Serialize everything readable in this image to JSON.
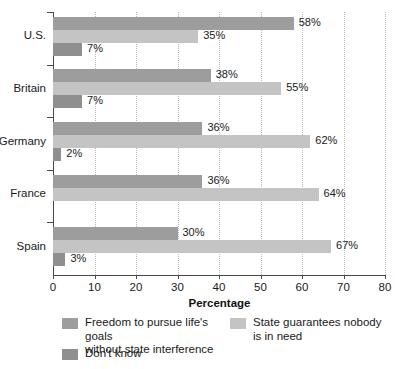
{
  "chart_data": {
    "type": "bar",
    "orientation": "horizontal",
    "title": "",
    "xlabel": "Percentage",
    "ylabel": "",
    "xlim": [
      0,
      80
    ],
    "xticks": [
      0,
      10,
      20,
      30,
      40,
      50,
      60,
      70,
      80
    ],
    "grid": true,
    "grid_style": "dotted-vertical",
    "legend_position": "bottom",
    "categories": [
      "U.S.",
      "Britain",
      "Germany",
      "France",
      "Spain"
    ],
    "series": [
      {
        "name": "Freedom to pursue life's goals without state interference",
        "color": "#9d9d9d",
        "values": [
          58,
          38,
          36,
          36,
          30
        ],
        "labels": [
          "58%",
          "38%",
          "36%",
          "36%",
          "30%"
        ]
      },
      {
        "name": "State guarantees nobody is in need",
        "color": "#c4c4c4",
        "values": [
          35,
          55,
          62,
          64,
          67
        ],
        "labels": [
          "35%",
          "55%",
          "62%",
          "64%",
          "67%"
        ]
      },
      {
        "name": "Don't know",
        "color": "#8f8f8f",
        "values": [
          7,
          7,
          2,
          0,
          3
        ],
        "labels": [
          "7%",
          "7%",
          "2%",
          "",
          "3%"
        ]
      }
    ]
  },
  "axis": {
    "x_title": "Percentage",
    "tick_labels": [
      "0",
      "10",
      "20",
      "30",
      "40",
      "50",
      "60",
      "70",
      "80"
    ]
  },
  "categories": {
    "c0": "U.S.",
    "c1": "Britain",
    "c2": "Germany",
    "c3": "France",
    "c4": "Spain"
  },
  "values": {
    "us": {
      "freedom": "58%",
      "state": "35%",
      "dk": "7%"
    },
    "britain": {
      "freedom": "38%",
      "state": "55%",
      "dk": "7%"
    },
    "germany": {
      "freedom": "36%",
      "state": "62%",
      "dk": "2%"
    },
    "france": {
      "freedom": "36%",
      "state": "64%",
      "dk": ""
    },
    "spain": {
      "freedom": "30%",
      "state": "67%",
      "dk": "3%"
    }
  },
  "legend": {
    "items": [
      {
        "label": "Freedom to pursue life's goals\nwithout state interference",
        "color": "#9d9d9d"
      },
      {
        "label": "State guarantees nobody\nis in need",
        "color": "#c4c4c4"
      },
      {
        "label": "Don't know",
        "color": "#8f8f8f"
      }
    ]
  },
  "colors": {
    "series_freedom": "#9d9d9d",
    "series_state": "#c4c4c4",
    "series_dontknow": "#8f8f8f",
    "axis": "#4a4a4a",
    "grid": "#b9b9b9",
    "text": "#1a1a1a",
    "background": "#ffffff"
  }
}
